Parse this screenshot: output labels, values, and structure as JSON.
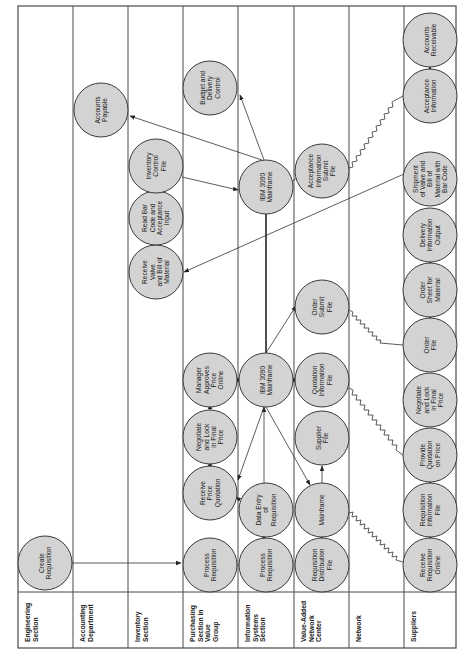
{
  "diagram": {
    "orientation": "rotated -90deg (read bottom-to-top)",
    "colors": {
      "node_fill": "#d3d3d3",
      "node_stroke": "#3a3a3a",
      "line": "#333333",
      "background": "#ffffff"
    },
    "lanes": [
      {
        "id": "engineering",
        "label_lines": [
          "Engineering",
          "Section"
        ]
      },
      {
        "id": "accounting",
        "label_lines": [
          "Accounting",
          "Department"
        ]
      },
      {
        "id": "inventory",
        "label_lines": [
          "Inventory",
          "Section"
        ]
      },
      {
        "id": "purchasing",
        "label_lines": [
          "Purchasing",
          "Section in",
          "Value",
          "Group"
        ]
      },
      {
        "id": "infosys",
        "label_lines": [
          "Information",
          "Systems",
          "Section"
        ]
      },
      {
        "id": "van",
        "label_lines": [
          "Value-Added",
          "Network",
          "Center"
        ]
      },
      {
        "id": "network",
        "label_lines": [
          "Network"
        ]
      },
      {
        "id": "suppliers",
        "label_lines": [
          "Suppliers"
        ]
      }
    ],
    "nodes": [
      {
        "id": "create_req",
        "lane": "engineering",
        "label_lines": [
          "Create",
          "Requisition"
        ]
      },
      {
        "id": "accounts_payable",
        "lane": "accounting",
        "label_lines": [
          "Accounts",
          "Payable"
        ]
      },
      {
        "id": "receive_valve",
        "lane": "inventory",
        "label_lines": [
          "Receive",
          "Valve",
          "and Bill of",
          "Material"
        ]
      },
      {
        "id": "read_bar_code",
        "lane": "inventory",
        "label_lines": [
          "Read Bar",
          "Code and",
          "Acceptance",
          "Input"
        ]
      },
      {
        "id": "inventory_control",
        "lane": "inventory",
        "label_lines": [
          "Inventory",
          "Control",
          "File"
        ]
      },
      {
        "id": "budget_delivery",
        "lane": "purchasing",
        "label_lines": [
          "Budget and",
          "Delivery",
          "Control"
        ]
      },
      {
        "id": "process_req_purch",
        "lane": "purchasing",
        "label_lines": [
          "Process",
          "Requisition"
        ]
      },
      {
        "id": "receive_price_quote",
        "lane": "purchasing",
        "label_lines": [
          "Receive",
          "Price",
          "Quotation"
        ]
      },
      {
        "id": "negotiate_purch",
        "lane": "purchasing",
        "label_lines": [
          "Negotiate",
          "and Lock",
          "in Final",
          "Price"
        ]
      },
      {
        "id": "manager_approves",
        "lane": "purchasing",
        "label_lines": [
          "Manager",
          "Approves",
          "Price",
          "Online"
        ]
      },
      {
        "id": "process_req_is",
        "lane": "infosys",
        "label_lines": [
          "Process",
          "Requisition"
        ]
      },
      {
        "id": "data_entry",
        "lane": "infosys",
        "label_lines": [
          "Data Entry",
          "of",
          "Requisition"
        ]
      },
      {
        "id": "ibm_3090_low",
        "lane": "infosys",
        "label_lines": [
          "IBM 3090",
          "Mainframe"
        ]
      },
      {
        "id": "ibm_3090_high",
        "lane": "infosys",
        "label_lines": [
          "IBM 3090",
          "Mainframe"
        ]
      },
      {
        "id": "req_dist_file",
        "lane": "van",
        "label_lines": [
          "Requisition",
          "Distribution",
          "File"
        ]
      },
      {
        "id": "mainframe_van",
        "lane": "van",
        "label_lines": [
          "Mainframe"
        ]
      },
      {
        "id": "supplier_file",
        "lane": "van",
        "label_lines": [
          "Supplier",
          "File"
        ]
      },
      {
        "id": "quotation_info_file",
        "lane": "van",
        "label_lines": [
          "Quotation",
          "Information",
          "File"
        ]
      },
      {
        "id": "order_submit_file",
        "lane": "van",
        "label_lines": [
          "Order",
          "Submit",
          "File"
        ]
      },
      {
        "id": "acceptance_submit_file",
        "lane": "van",
        "label_lines": [
          "Acceptance",
          "Information",
          "Submit",
          "File"
        ]
      },
      {
        "id": "receive_req_online",
        "lane": "suppliers",
        "label_lines": [
          "Receive",
          "Requisition",
          "Online"
        ]
      },
      {
        "id": "req_info_file",
        "lane": "suppliers",
        "label_lines": [
          "Requisition",
          "Information",
          "File"
        ]
      },
      {
        "id": "provide_quotation",
        "lane": "suppliers",
        "label_lines": [
          "Provide",
          "Quotation",
          "on Price"
        ]
      },
      {
        "id": "negotiate_sup",
        "lane": "suppliers",
        "label_lines": [
          "Negotiate",
          "and Lock",
          "in Final",
          "Price"
        ]
      },
      {
        "id": "order_file",
        "lane": "suppliers",
        "label_lines": [
          "Order",
          "File"
        ]
      },
      {
        "id": "order_sheet",
        "lane": "suppliers",
        "label_lines": [
          "Order",
          "Sheet for",
          "Material"
        ]
      },
      {
        "id": "delivery_info_output",
        "lane": "suppliers",
        "label_lines": [
          "Delivery",
          "Information",
          "Output"
        ]
      },
      {
        "id": "shipment",
        "lane": "suppliers",
        "label_lines": [
          "Shipment",
          "of Valve and",
          "Bill of",
          "Material with",
          "Bar Code"
        ]
      },
      {
        "id": "acceptance_info",
        "lane": "suppliers",
        "label_lines": [
          "Acceptance",
          "Information"
        ]
      },
      {
        "id": "accounts_receivable",
        "lane": "suppliers",
        "label_lines": [
          "Accounts",
          "Receivable"
        ]
      }
    ],
    "edges": [
      {
        "from": "create_req",
        "to": "process_req_purch",
        "style": "arrow"
      },
      {
        "from": "process_req_purch",
        "to": "process_req_is",
        "style": "arrow"
      },
      {
        "from": "process_req_is",
        "to": "data_entry",
        "style": "arrow"
      },
      {
        "from": "data_entry",
        "to": "ibm_3090_low",
        "style": "arrow"
      },
      {
        "from": "data_entry",
        "to": "receive_price_quote",
        "style": "arrow"
      },
      {
        "from": "receive_price_quote",
        "to": "negotiate_purch",
        "style": "arrow"
      },
      {
        "from": "negotiate_purch",
        "to": "manager_approves",
        "style": "arrow"
      },
      {
        "from": "manager_approves",
        "to": "ibm_3090_low",
        "style": "arrow"
      },
      {
        "from": "ibm_3090_low",
        "to": "mainframe_van",
        "style": "arrow"
      },
      {
        "from": "ibm_3090_low",
        "to": "order_submit_file",
        "style": "arrow"
      },
      {
        "from": "quotation_info_file",
        "to": "ibm_3090_low",
        "style": "arrow"
      },
      {
        "from": "supplier_file",
        "to": "ibm_3090_low",
        "style": "arrow"
      },
      {
        "from": "mainframe_van",
        "to": "req_dist_file",
        "style": "arrow"
      },
      {
        "from": "mainframe_van",
        "to": "supplier_file",
        "style": "arrow"
      },
      {
        "from": "ibm_3090_low",
        "to": "ibm_3090_high",
        "style": "bold-line"
      },
      {
        "from": "mainframe_van",
        "to": "receive_req_online",
        "style": "zigzag"
      },
      {
        "from": "provide_quotation",
        "to": "quotation_info_file",
        "style": "zigzag"
      },
      {
        "from": "order_submit_file",
        "to": "order_file",
        "style": "zigzag"
      },
      {
        "from": "acceptance_submit_file",
        "to": "acceptance_info",
        "style": "zigzag"
      },
      {
        "from": "receive_req_online",
        "to": "req_info_file",
        "style": "arrow"
      },
      {
        "from": "req_info_file",
        "to": "provide_quotation",
        "style": "arrow"
      },
      {
        "from": "order_file",
        "to": "order_sheet",
        "style": "arrow"
      },
      {
        "from": "order_sheet",
        "to": "delivery_info_output",
        "style": "arrow"
      },
      {
        "from": "acceptance_info",
        "to": "accounts_receivable",
        "style": "arrow"
      },
      {
        "from": "shipment",
        "to": "receive_valve",
        "style": "arrow"
      },
      {
        "from": "receive_valve",
        "to": "read_bar_code",
        "style": "arrow"
      },
      {
        "from": "read_bar_code",
        "to": "inventory_control",
        "style": "arrow"
      },
      {
        "from": "inventory_control",
        "to": "ibm_3090_high",
        "style": "arrow"
      },
      {
        "from": "ibm_3090_high",
        "to": "accounts_payable",
        "style": "arrow"
      },
      {
        "from": "ibm_3090_high",
        "to": "budget_delivery",
        "style": "arrow"
      },
      {
        "from": "ibm_3090_high",
        "to": "acceptance_submit_file",
        "style": "arrow"
      }
    ]
  }
}
